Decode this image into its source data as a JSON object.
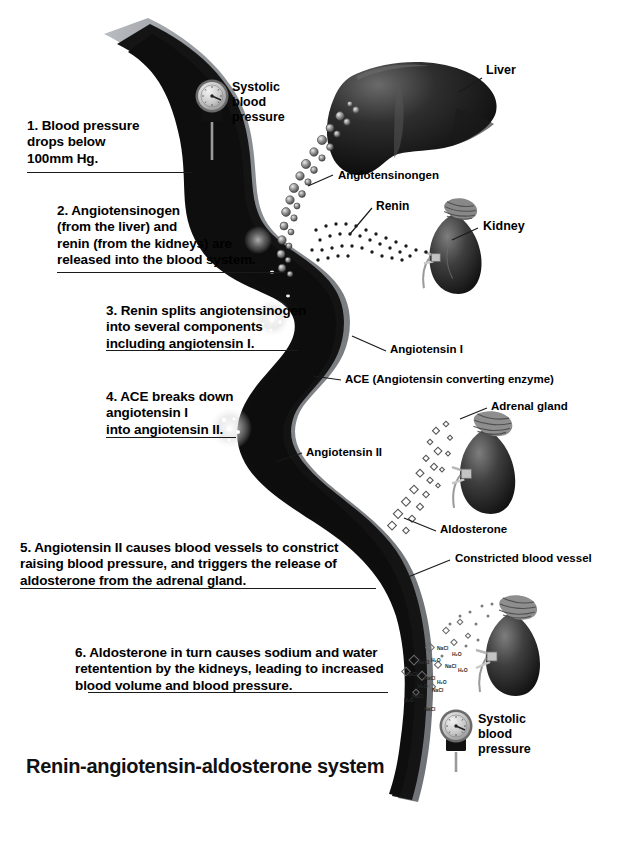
{
  "diagram": {
    "title": "Renin-angiotensin-aldosterone system",
    "background_color": "#ffffff",
    "text_color": "#000000",
    "vessel_wall_color": "#8c8f93",
    "vessel_lumen_color": "#111111",
    "organ_color": "#3a3a3a"
  },
  "steps": [
    {
      "number": "1",
      "text": "1. Blood pressure\ndrops below\n100mm Hg."
    },
    {
      "number": "2",
      "text": "2. Angiotensinogen\n(from the liver) and\nrenin (from the kidneys) are\nreleased into the blood system."
    },
    {
      "number": "3",
      "text": "3. Renin splits angiotensinogen\ninto several components\nincluding angiotensin I."
    },
    {
      "number": "4",
      "text": "4. ACE breaks down\nangiotensin I\ninto angiotensin II."
    },
    {
      "number": "5",
      "text": "5. Angiotensin II causes blood vessels to constrict\nraising blood pressure, and triggers the release of\naldosterone from the adrenal gland."
    },
    {
      "number": "6",
      "text": "6. Aldosterone in turn causes sodium and water\nretentention by the kidneys, leading to increased\nblood volume and blood pressure."
    }
  ],
  "callouts": {
    "systolic_top": "Systolic\nblood\npressure",
    "systolic_bottom": "Systolic\nblood\npressure",
    "liver": "Liver",
    "angiotensinogen": "Angiotensinongen",
    "renin": "Renin",
    "kidney": "Kidney",
    "angiotensin_i": "Angiotensin I",
    "ace": "ACE (Angiotensin converting enzyme)",
    "adrenal_gland": "Adrenal gland",
    "angiotensin_ii": "Angiotensin II",
    "aldosterone": "Aldosterone",
    "constricted_vessel": "Constricted blood vessel"
  },
  "molecules": {
    "salt": "NaCl",
    "water": "H₂O",
    "salt_labels": [
      "NaCl",
      "NaCl",
      "NaCl",
      "NaCl",
      "NaCl",
      "NaCl",
      "NaCl",
      "NaCl"
    ],
    "water_labels": [
      "H₂O",
      "H₂O",
      "H₂O",
      "H₂O",
      "H₂O",
      "H₂O"
    ]
  }
}
